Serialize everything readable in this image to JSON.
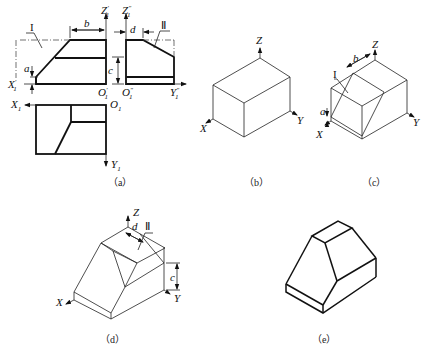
{
  "figures": [
    {
      "id": "a",
      "caption": "（a）",
      "description": "Three-view orthographic projection",
      "labels": {
        "front_z": "Z",
        "front_z_sup": "′",
        "front_z_sub": "1",
        "side_z": "Z",
        "side_z_sup": "″",
        "side_z_sub": "1",
        "front_x": "X",
        "front_x_sup": "′",
        "front_x_sub": "1",
        "front_o": "O",
        "front_o_sup": "′",
        "front_o_sub": "1",
        "side_o": "O",
        "side_o_sup": "″",
        "side_o_sub": "1",
        "side_y": "Y",
        "side_y_sup": "″",
        "side_y_sub": "1",
        "top_x": "X",
        "top_x_sub": "1",
        "top_o": "O",
        "top_o_sub": "1",
        "top_y": "Y",
        "top_y_sub": "1",
        "dim_a": "a",
        "dim_b": "b",
        "dim_c": "c",
        "dim_d": "d",
        "plane_1": "I",
        "plane_2": "Ⅱ"
      }
    },
    {
      "id": "b",
      "caption": "（b）",
      "description": "Isometric bounding box",
      "labels": {
        "z": "Z",
        "x": "X",
        "y": "Y"
      }
    },
    {
      "id": "c",
      "caption": "（c）",
      "description": "Cut by plane I",
      "labels": {
        "z": "Z",
        "x": "X",
        "y": "Y",
        "dim_a": "a",
        "dim_b": "b",
        "plane_1": "I"
      }
    },
    {
      "id": "d",
      "caption": "（d）",
      "description": "Cut by plane II",
      "labels": {
        "z": "Z",
        "x": "X",
        "y": "Y",
        "dim_c": "c",
        "dim_d": "d",
        "plane_2": "Ⅱ"
      }
    },
    {
      "id": "e",
      "caption": "（e）",
      "description": "Final isometric solid"
    }
  ]
}
